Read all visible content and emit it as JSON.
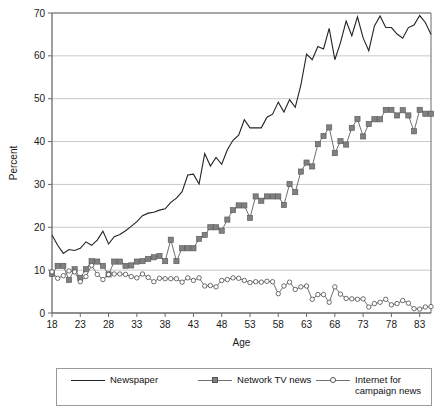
{
  "chart_data": {
    "type": "line",
    "title": "",
    "xlabel": "Age",
    "ylabel": "Percent",
    "xlim": [
      18,
      85
    ],
    "ylim": [
      0,
      70
    ],
    "xticks": [
      18,
      23,
      28,
      33,
      38,
      43,
      48,
      53,
      58,
      63,
      68,
      73,
      78,
      83
    ],
    "yticks": [
      0,
      10,
      20,
      30,
      40,
      50,
      60,
      70
    ],
    "grid": "horizontal",
    "legend_position": "below-plot",
    "colors": {
      "newspaper": "#222222",
      "network_tv": "#808080",
      "internet": "#6f6f6f",
      "gridline": "#c9c9c9",
      "axis": "#6a6a6a"
    },
    "x": [
      18,
      19,
      20,
      21,
      22,
      23,
      24,
      25,
      26,
      27,
      28,
      29,
      30,
      31,
      32,
      33,
      34,
      35,
      36,
      37,
      38,
      39,
      40,
      41,
      42,
      43,
      44,
      45,
      46,
      47,
      48,
      49,
      50,
      51,
      52,
      53,
      54,
      55,
      56,
      57,
      58,
      59,
      60,
      61,
      62,
      63,
      64,
      65,
      66,
      67,
      68,
      69,
      70,
      71,
      72,
      73,
      74,
      75,
      76,
      77,
      78,
      79,
      80,
      81,
      82,
      83,
      84,
      85
    ],
    "series": [
      {
        "name": "Newspaper",
        "marker": "none",
        "values": [
          18.2,
          15.8,
          13.9,
          14.8,
          14.6,
          15.1,
          16.6,
          15.8,
          17.0,
          19.1,
          16.1,
          17.8,
          18.3,
          19.2,
          20.2,
          21.3,
          22.7,
          23.3,
          23.5,
          24.0,
          24.3,
          25.8,
          26.8,
          28.3,
          32.2,
          32.4,
          30.1,
          37.2,
          34.3,
          36.3,
          34.7,
          38.1,
          40.3,
          41.5,
          45.1,
          43.2,
          43.2,
          43.2,
          45.7,
          46.4,
          49.2,
          46.9,
          49.8,
          48.0,
          53.2,
          60.4,
          59.1,
          62.2,
          61.6,
          66.4,
          59.1,
          63.1,
          68.1,
          64.7,
          69.1,
          64.2,
          61.2,
          67.0,
          69.3,
          66.6,
          66.6,
          65.1,
          64.1,
          66.6,
          67.2,
          69.4,
          67.8,
          65.0
        ]
      },
      {
        "name": "Network TV news",
        "marker": "filled-square",
        "values": [
          9.1,
          11.0,
          11.0,
          7.7,
          10.2,
          8.2,
          10.2,
          12.1,
          12.0,
          11.0,
          9.0,
          12.0,
          12.0,
          11.0,
          11.1,
          12.0,
          12.1,
          12.6,
          13.0,
          13.3,
          12.1,
          17.1,
          12.1,
          15.1,
          15.1,
          15.1,
          17.3,
          18.2,
          20.0,
          20.0,
          19.2,
          21.8,
          24.0,
          25.1,
          25.1,
          22.2,
          27.2,
          26.2,
          27.2,
          27.2,
          27.2,
          25.2,
          30.1,
          28.2,
          33.0,
          35.1,
          34.2,
          39.4,
          41.3,
          43.3,
          37.3,
          40.1,
          39.3,
          43.2,
          45.3,
          41.2,
          44.1,
          45.2,
          45.2,
          47.4,
          47.4,
          46.1,
          47.3,
          46.1,
          42.4,
          47.4,
          46.5,
          46.5
        ]
      },
      {
        "name": "Internet for\ncampaign news",
        "marker": "open-circle",
        "values": [
          9.6,
          8.1,
          8.7,
          9.8,
          9.6,
          7.3,
          8.5,
          11.1,
          9.0,
          7.8,
          9.0,
          9.1,
          9.1,
          9.0,
          8.5,
          8.2,
          9.1,
          8.3,
          7.3,
          8.1,
          8.0,
          8.0,
          8.0,
          7.2,
          8.2,
          7.6,
          8.2,
          6.3,
          6.4,
          6.1,
          7.6,
          7.8,
          8.2,
          8.1,
          7.6,
          7.1,
          7.3,
          7.2,
          7.4,
          7.3,
          4.5,
          6.3,
          7.2,
          5.5,
          6.1,
          6.3,
          3.2,
          4.3,
          4.3,
          2.5,
          6.1,
          4.4,
          3.4,
          3.3,
          3.2,
          3.3,
          1.4,
          2.2,
          2.5,
          3.2,
          1.9,
          2.2,
          2.9,
          2.3,
          1.0,
          0.9,
          1.4,
          1.5
        ]
      }
    ]
  },
  "legend": {
    "items": [
      {
        "label": "Newspaper",
        "key": "plain-line"
      },
      {
        "label": "Network TV news",
        "key": "square-line"
      },
      {
        "label": "Internet for\ncampaign news",
        "key": "circle-line"
      }
    ]
  },
  "axes": {
    "x_title": "Age",
    "y_title": "Percent"
  }
}
